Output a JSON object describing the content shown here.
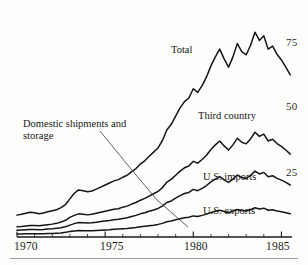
{
  "figure": {
    "background_color": "#fdfdfc",
    "ink_color": "#1b1b1b",
    "footer_rule_color": "#9a9a9a"
  },
  "axes": {
    "y_ticks": [
      {
        "value": 75,
        "label": "75"
      },
      {
        "value": 50,
        "label": "50"
      },
      {
        "value": 25,
        "label": "25"
      }
    ],
    "y_side": "right",
    "x_ticks": [
      {
        "value": 1970,
        "label": "1970"
      },
      {
        "value": 1975,
        "label": "1975"
      },
      {
        "value": 1980,
        "label": "1980"
      },
      {
        "value": 1985,
        "label": "1985"
      }
    ],
    "x_minor_tick_interval": 1
  },
  "series_labels": {
    "total": "Total",
    "third_country": "Third country",
    "us_imports": "U.S. imports",
    "us_exports": "U.S. exports",
    "domestic": "Domestic shipments and storage"
  },
  "chart_data": {
    "type": "line",
    "title": "",
    "subtitle": "",
    "xlabel": "",
    "ylabel": "",
    "xlim": [
      1970,
      1985.6
    ],
    "ylim": [
      0,
      85
    ],
    "grid": false,
    "legend": "inline-annotations",
    "annotations": [
      {
        "text": "Total",
        "x": 1978.2,
        "y": 58,
        "leader": false
      },
      {
        "text": "Third country",
        "x": 1979.8,
        "y": 45,
        "leader": false
      },
      {
        "text": "U.S. imports",
        "x": 1980.1,
        "y": 27,
        "leader": false
      },
      {
        "text": "U.S. exports",
        "x": 1980.1,
        "y": 14,
        "leader": false
      },
      {
        "text": "Domestic shipments and storage",
        "x": 1970.5,
        "y": 44,
        "leader": true,
        "leader_to_x": 1979.6,
        "leader_to_y": 5
      }
    ],
    "x": [
      1970.0,
      1970.25,
      1970.5,
      1970.75,
      1971.0,
      1971.25,
      1971.5,
      1971.75,
      1972.0,
      1972.25,
      1972.5,
      1972.75,
      1973.0,
      1973.25,
      1973.5,
      1973.75,
      1974.0,
      1974.25,
      1974.5,
      1974.75,
      1975.0,
      1975.25,
      1975.5,
      1975.75,
      1976.0,
      1976.25,
      1976.5,
      1976.75,
      1977.0,
      1977.25,
      1977.5,
      1977.75,
      1978.0,
      1978.25,
      1978.5,
      1978.75,
      1979.0,
      1979.25,
      1979.5,
      1979.75,
      1980.0,
      1980.25,
      1980.5,
      1980.75,
      1981.0,
      1981.25,
      1981.5,
      1981.75,
      1982.0,
      1982.25,
      1982.5,
      1982.75,
      1983.0,
      1983.25,
      1983.5,
      1983.75,
      1984.0,
      1984.25,
      1984.5,
      1984.75,
      1985.0,
      1985.25,
      1985.5
    ],
    "series": [
      {
        "name": "Total",
        "values": [
          8.5,
          8.8,
          9.2,
          9.6,
          9.4,
          9.0,
          9.3,
          9.8,
          10.2,
          10.6,
          11.4,
          12.6,
          14.8,
          17.0,
          18.3,
          18.0,
          17.6,
          17.9,
          18.6,
          19.4,
          20.2,
          21.0,
          21.8,
          22.3,
          23.2,
          24.0,
          25.4,
          26.6,
          28.4,
          29.6,
          31.4,
          33.0,
          34.6,
          37.5,
          41.6,
          43.8,
          47.0,
          50.2,
          52.6,
          54.0,
          57.6,
          56.2,
          58.8,
          62.2,
          66.5,
          70.0,
          73.0,
          69.2,
          66.0,
          70.0,
          75.2,
          72.0,
          70.8,
          74.5,
          79.6,
          76.4,
          78.2,
          73.0,
          74.2,
          71.0,
          68.8,
          66.0,
          63.0
        ]
      },
      {
        "name": "Third country",
        "values": [
          4.0,
          4.1,
          4.3,
          4.5,
          4.5,
          4.4,
          4.6,
          4.8,
          5.0,
          5.3,
          5.8,
          6.5,
          7.6,
          8.4,
          9.0,
          8.8,
          8.6,
          8.8,
          9.2,
          9.6,
          10.0,
          10.4,
          10.8,
          11.0,
          11.6,
          12.0,
          12.8,
          13.4,
          14.3,
          15.0,
          15.9,
          16.8,
          17.7,
          19.2,
          21.3,
          22.4,
          24.0,
          25.6,
          26.9,
          27.6,
          29.4,
          28.7,
          30.1,
          31.8,
          34.0,
          35.8,
          37.3,
          35.4,
          33.8,
          35.8,
          38.4,
          36.8,
          36.2,
          38.1,
          40.7,
          39.1,
          40.0,
          37.3,
          38.0,
          36.3,
          35.2,
          33.8,
          32.2
        ]
      },
      {
        "name": "U.S. imports",
        "values": [
          2.6,
          2.7,
          2.8,
          2.9,
          2.9,
          2.8,
          2.9,
          3.1,
          3.2,
          3.4,
          3.6,
          4.0,
          4.6,
          5.2,
          5.6,
          5.5,
          5.4,
          5.5,
          5.7,
          6.0,
          6.2,
          6.4,
          6.7,
          6.9,
          7.2,
          7.5,
          8.0,
          8.4,
          9.0,
          9.4,
          10.0,
          10.5,
          11.1,
          12.0,
          13.4,
          14.0,
          15.1,
          16.1,
          16.9,
          17.3,
          18.5,
          18.0,
          18.9,
          20.0,
          21.4,
          22.5,
          23.5,
          22.2,
          21.2,
          22.5,
          24.1,
          23.1,
          22.7,
          23.9,
          25.6,
          24.5,
          25.1,
          23.4,
          23.8,
          22.8,
          22.1,
          21.2,
          20.2
        ]
      },
      {
        "name": "U.S. exports",
        "values": [
          1.2,
          1.2,
          1.3,
          1.3,
          1.3,
          1.3,
          1.3,
          1.4,
          1.4,
          1.5,
          1.6,
          1.8,
          2.1,
          2.3,
          2.5,
          2.4,
          2.4,
          2.4,
          2.5,
          2.6,
          2.7,
          2.8,
          3.0,
          3.1,
          3.2,
          3.3,
          3.5,
          3.7,
          4.0,
          4.2,
          4.4,
          4.6,
          4.9,
          5.3,
          5.9,
          6.2,
          6.7,
          7.1,
          7.5,
          7.7,
          8.2,
          8.0,
          8.4,
          8.9,
          9.5,
          10.0,
          10.4,
          9.9,
          9.4,
          10.0,
          10.7,
          10.3,
          10.1,
          10.6,
          11.4,
          10.9,
          11.2,
          10.4,
          10.6,
          10.1,
          9.8,
          9.4,
          9.0
        ]
      }
    ]
  }
}
